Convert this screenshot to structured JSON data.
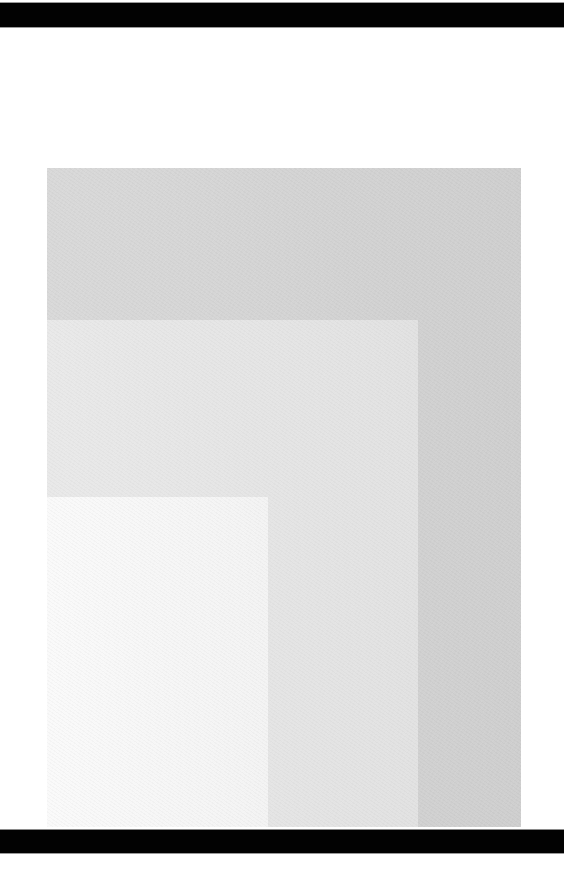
{
  "scene": {
    "background": "#ffffff",
    "bars": {
      "top": {
        "color": "#020202"
      },
      "bottom": {
        "color": "#020202"
      }
    },
    "swatches": [
      {
        "name": "outer-gray-paper",
        "color": "#d9d9d9",
        "gradient_end": "#cfcfcf",
        "x": 47,
        "y": 168,
        "w": 474,
        "h": 659
      },
      {
        "name": "middle-light-paper",
        "color": "#e9e9e9",
        "gradient_end": "#e2e2e2",
        "x": 47,
        "y": 320,
        "w": 371,
        "h": 507
      },
      {
        "name": "inner-white-paper",
        "color": "#fafafa",
        "gradient_end": "#f3f3f3",
        "x": 47,
        "y": 497,
        "w": 221,
        "h": 330
      }
    ]
  }
}
